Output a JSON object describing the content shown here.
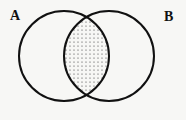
{
  "diagram": {
    "type": "venn",
    "sets": [
      {
        "label": "A",
        "cx": 64,
        "cy": 56,
        "r": 45
      },
      {
        "label": "B",
        "cx": 109,
        "cy": 56,
        "r": 45
      }
    ],
    "shaded_region": "A ∩ B",
    "shading": "dotted",
    "colors": {
      "stroke": "#111111",
      "dots": "#333333",
      "background": "#f7f7f5"
    }
  }
}
